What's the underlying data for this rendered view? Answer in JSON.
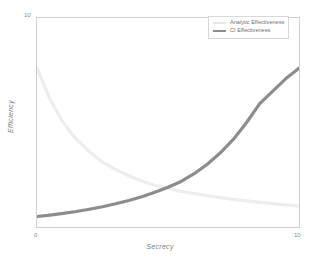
{
  "chart_data": {
    "type": "line",
    "title": "",
    "subtitle": "",
    "xlabel": "Secrecy",
    "ylabel": "Efficiency",
    "xlim": [
      0,
      10
    ],
    "ylim": [
      0,
      10
    ],
    "xticks": [
      "0",
      "10"
    ],
    "yticks": [
      "10"
    ],
    "grid": false,
    "legend_position": "top-right",
    "x": [
      0,
      0.5,
      1,
      1.5,
      2,
      2.5,
      3,
      3.5,
      4,
      4.5,
      5,
      5.5,
      6,
      6.5,
      7,
      7.5,
      8,
      8.5,
      9,
      9.5,
      10
    ],
    "series": [
      {
        "name": "Analytic Effectiveness",
        "color": "#ededed",
        "values": [
          7.6,
          6.1,
          5.0,
          4.2,
          3.6,
          3.1,
          2.75,
          2.45,
          2.2,
          2.0,
          1.85,
          1.7,
          1.6,
          1.5,
          1.4,
          1.32,
          1.25,
          1.18,
          1.12,
          1.06,
          1.0
        ]
      },
      {
        "name": "CI Effectiveness",
        "color": "#8c8c8c",
        "values": [
          0.5,
          0.57,
          0.65,
          0.74,
          0.85,
          0.97,
          1.11,
          1.27,
          1.45,
          1.66,
          1.9,
          2.18,
          2.55,
          3.0,
          3.55,
          4.2,
          5.0,
          5.9,
          6.5,
          7.1,
          7.6
        ]
      }
    ]
  },
  "axes": {
    "x_tick_min": "0",
    "x_tick_max": "10",
    "y_tick_max": "10",
    "x_title": "Secrecy",
    "y_title": "Efficiency"
  },
  "legend": {
    "entries": [
      {
        "label": "Analytic Effectiveness",
        "color": "#e8e8e8"
      },
      {
        "label": "CI Effectiveness",
        "color": "#8c8c8c"
      }
    ]
  },
  "colors": {
    "background": "#ffffff",
    "frame": "#cfcfcf",
    "analytic": "#ededed",
    "ci": "#8c8c8c",
    "text": "#7d7d7d"
  }
}
